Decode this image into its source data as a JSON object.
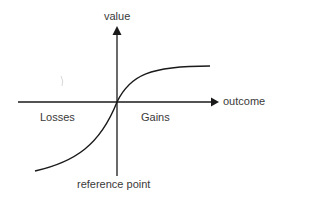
{
  "diagram": {
    "type": "prospect-theory-value-function",
    "labels": {
      "y_axis": "value",
      "x_axis": "outcome",
      "left_region": "Losses",
      "right_region": "Gains",
      "origin": "reference point"
    },
    "colors": {
      "stroke": "#1a1a1a",
      "text": "#3a3a3a",
      "background": "#ffffff"
    }
  }
}
